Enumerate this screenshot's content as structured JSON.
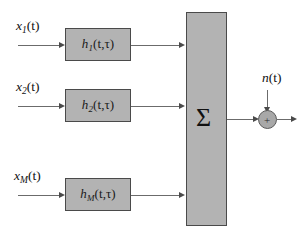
{
  "diagram": {
    "colors": {
      "block_fill": "#b3b3b3",
      "block_border": "#4a4a4a",
      "wire": "#6b6b6b",
      "background": "#ffffff",
      "text": "#111111"
    },
    "inputs": [
      {
        "name": "input-1",
        "label_base": "x",
        "label_sub": "1",
        "label_arg": "(t)",
        "text": "x1(t)"
      },
      {
        "name": "input-2",
        "label_base": "x",
        "label_sub": "2",
        "label_arg": "(t)",
        "text": "x2(t)"
      },
      {
        "name": "input-M",
        "label_base": "x",
        "label_sub": "M",
        "label_arg": "(t)",
        "text": "xM(t)"
      }
    ],
    "filters": [
      {
        "name": "filter-1",
        "label_base": "h",
        "label_sub": "1",
        "label_arg": "(t,τ)",
        "text": "h1(t,τ)"
      },
      {
        "name": "filter-2",
        "label_base": "h",
        "label_sub": "2",
        "label_arg": "(t,τ)",
        "text": "h2(t,τ)"
      },
      {
        "name": "filter-M",
        "label_base": "h",
        "label_sub": "M",
        "label_arg": "(t,τ)",
        "text": "hM(t,τ)"
      }
    ],
    "summer": {
      "name": "summation-block",
      "symbol": "Σ"
    },
    "noise": {
      "name": "noise-source",
      "label_base": "n",
      "label_arg": "(t)",
      "text": "n(t)"
    },
    "adder": {
      "name": "output-adder",
      "symbol": "+"
    }
  }
}
